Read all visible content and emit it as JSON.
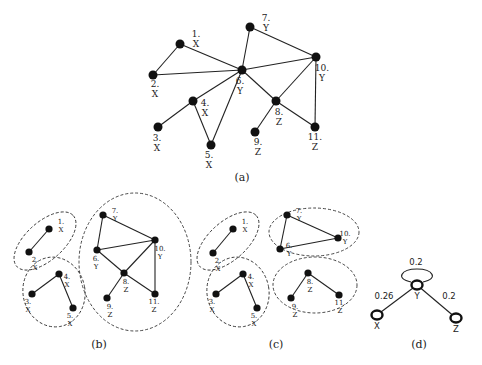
{
  "panels": {
    "a": {
      "caption": "(a)",
      "caption_pos": [
        242,
        181
      ],
      "node_radius": 4.5,
      "label_class": "lbl-a",
      "nodes": [
        {
          "id": "1",
          "x": 180,
          "y": 44,
          "num": "1.",
          "cls": "X",
          "lx": 196,
          "ly": 37
        },
        {
          "id": "2",
          "x": 153,
          "y": 75,
          "num": "2.",
          "cls": "X",
          "lx": 155,
          "ly": 87
        },
        {
          "id": "3",
          "x": 158,
          "y": 127,
          "num": "3.",
          "cls": "X",
          "lx": 157,
          "ly": 141
        },
        {
          "id": "4",
          "x": 193,
          "y": 101,
          "num": "4.",
          "cls": "X",
          "lx": 205,
          "ly": 106
        },
        {
          "id": "5",
          "x": 211,
          "y": 145,
          "num": "5.",
          "cls": "X",
          "lx": 209,
          "ly": 158
        },
        {
          "id": "6",
          "x": 242,
          "y": 70,
          "num": "6.",
          "cls": "Y",
          "lx": 240,
          "ly": 84
        },
        {
          "id": "7",
          "x": 250,
          "y": 27,
          "num": "7.",
          "cls": "Y",
          "lx": 266,
          "ly": 21
        },
        {
          "id": "8",
          "x": 276,
          "y": 101,
          "num": "8.",
          "cls": "Z",
          "lx": 279,
          "ly": 115
        },
        {
          "id": "9",
          "x": 255,
          "y": 132,
          "num": "9.",
          "cls": "Z",
          "lx": 258,
          "ly": 145
        },
        {
          "id": "10",
          "x": 316,
          "y": 57,
          "num": "10.",
          "cls": "Y",
          "lx": 322,
          "ly": 71
        },
        {
          "id": "11",
          "x": 315,
          "y": 127,
          "num": "11.",
          "cls": "Z",
          "lx": 315,
          "ly": 140
        }
      ],
      "edges": [
        [
          "1",
          "2"
        ],
        [
          "1",
          "6"
        ],
        [
          "2",
          "6"
        ],
        [
          "6",
          "7"
        ],
        [
          "6",
          "10"
        ],
        [
          "7",
          "10"
        ],
        [
          "6",
          "4"
        ],
        [
          "6",
          "5"
        ],
        [
          "4",
          "3"
        ],
        [
          "4",
          "5"
        ],
        [
          "6",
          "8"
        ],
        [
          "8",
          "10"
        ],
        [
          "10",
          "11"
        ],
        [
          "8",
          "11"
        ],
        [
          "8",
          "9"
        ]
      ]
    },
    "b": {
      "caption": "(b)",
      "caption_pos": [
        99,
        348
      ],
      "node_radius": 3.6,
      "label_class": "lbl-s",
      "clusters": [
        {
          "cx": 45,
          "cy": 241,
          "rx": 38,
          "ry": 19,
          "rot": -42
        },
        {
          "cx": 54,
          "cy": 292,
          "rx": 31,
          "ry": 35,
          "rot": -10
        },
        {
          "cx": 135,
          "cy": 262,
          "rx": 56,
          "ry": 69,
          "rot": 0
        }
      ],
      "nodes": [
        {
          "id": "1",
          "x": 49,
          "y": 229,
          "num": "1.",
          "cls": "X",
          "lx": 61,
          "ly": 224
        },
        {
          "id": "2",
          "x": 29,
          "y": 252,
          "num": "2.",
          "cls": "X",
          "lx": 35,
          "ly": 262
        },
        {
          "id": "3",
          "x": 32,
          "y": 294,
          "num": "3.",
          "cls": "X",
          "lx": 28,
          "ly": 304
        },
        {
          "id": "4",
          "x": 59,
          "y": 274,
          "num": "4.",
          "cls": "X",
          "lx": 67,
          "ly": 279
        },
        {
          "id": "5",
          "x": 73,
          "y": 308,
          "num": "5.",
          "cls": "X",
          "lx": 70,
          "ly": 318
        },
        {
          "id": "6",
          "x": 97,
          "y": 250,
          "num": "6.",
          "cls": "Y",
          "lx": 96,
          "ly": 261
        },
        {
          "id": "7",
          "x": 103,
          "y": 215,
          "num": "7.",
          "cls": "Y",
          "lx": 115,
          "ly": 213
        },
        {
          "id": "8",
          "x": 124,
          "y": 273,
          "num": "8.",
          "cls": "Z",
          "lx": 126,
          "ly": 284
        },
        {
          "id": "9",
          "x": 107,
          "y": 298,
          "num": "9.",
          "cls": "Z",
          "lx": 110,
          "ly": 309
        },
        {
          "id": "10",
          "x": 155,
          "y": 240,
          "num": "10.",
          "cls": "Y",
          "lx": 160,
          "ly": 251
        },
        {
          "id": "11",
          "x": 155,
          "y": 294,
          "num": "11.",
          "cls": "Z",
          "lx": 154,
          "ly": 304
        }
      ],
      "edges": [
        [
          "1",
          "2"
        ],
        [
          "4",
          "3"
        ],
        [
          "4",
          "5"
        ],
        [
          "7",
          "6"
        ],
        [
          "7",
          "10"
        ],
        [
          "6",
          "10"
        ],
        [
          "6",
          "8"
        ],
        [
          "8",
          "10"
        ],
        [
          "10",
          "11"
        ],
        [
          "8",
          "11"
        ],
        [
          "8",
          "9"
        ]
      ]
    },
    "c": {
      "caption": "(c)",
      "caption_pos": [
        276,
        348
      ],
      "node_radius": 3.6,
      "label_class": "lbl-s",
      "clusters": [
        {
          "cx": 228,
          "cy": 241,
          "rx": 38,
          "ry": 19,
          "rot": -42
        },
        {
          "cx": 238,
          "cy": 292,
          "rx": 31,
          "ry": 35,
          "rot": -10
        },
        {
          "cx": 314,
          "cy": 232,
          "rx": 45,
          "ry": 24,
          "rot": 0
        },
        {
          "cx": 315,
          "cy": 285,
          "rx": 42,
          "ry": 28,
          "rot": 0
        }
      ],
      "nodes": [
        {
          "id": "1",
          "x": 233,
          "y": 229,
          "num": "1.",
          "cls": "X",
          "lx": 245,
          "ly": 224
        },
        {
          "id": "2",
          "x": 213,
          "y": 253,
          "num": "2.",
          "cls": "X",
          "lx": 218,
          "ly": 263
        },
        {
          "id": "3",
          "x": 216,
          "y": 294,
          "num": "3.",
          "cls": "X",
          "lx": 212,
          "ly": 304
        },
        {
          "id": "4",
          "x": 243,
          "y": 274,
          "num": "4.",
          "cls": "X",
          "lx": 251,
          "ly": 279
        },
        {
          "id": "5",
          "x": 257,
          "y": 308,
          "num": "5.",
          "cls": "X",
          "lx": 254,
          "ly": 318
        },
        {
          "id": "6",
          "x": 280,
          "y": 249,
          "num": "6.",
          "cls": "Y",
          "lx": 289,
          "ly": 248
        },
        {
          "id": "7",
          "x": 287,
          "y": 215,
          "num": "7.",
          "cls": "Y",
          "lx": 299,
          "ly": 213
        },
        {
          "id": "8",
          "x": 308,
          "y": 273,
          "num": "8.",
          "cls": "Z",
          "lx": 310,
          "ly": 284
        },
        {
          "id": "9",
          "x": 291,
          "y": 298,
          "num": "9.",
          "cls": "Z",
          "lx": 295,
          "ly": 309
        },
        {
          "id": "10",
          "x": 338,
          "y": 238,
          "num": "10.",
          "cls": "Y",
          "lx": 345,
          "ly": 236
        },
        {
          "id": "11",
          "x": 339,
          "y": 295,
          "num": "11.",
          "cls": "Z",
          "lx": 340,
          "ly": 305
        }
      ],
      "edges": [
        [
          "1",
          "2"
        ],
        [
          "4",
          "3"
        ],
        [
          "4",
          "5"
        ],
        [
          "7",
          "6"
        ],
        [
          "7",
          "10"
        ],
        [
          "6",
          "10"
        ],
        [
          "8",
          "9"
        ],
        [
          "8",
          "11"
        ]
      ]
    },
    "d": {
      "caption": "(d)",
      "caption_pos": [
        419,
        348
      ],
      "nodes": [
        {
          "id": "X",
          "x": 377,
          "y": 315,
          "label": "X",
          "lx": 377,
          "ly": 329
        },
        {
          "id": "Y",
          "x": 417,
          "y": 285,
          "label": "Y",
          "lx": 417,
          "ly": 299
        },
        {
          "id": "Z",
          "x": 456,
          "y": 318,
          "label": "Z",
          "lx": 456,
          "ly": 332
        }
      ],
      "edges": [
        {
          "from": "Y",
          "to": "X",
          "weight": "0.26",
          "wx": 384,
          "wy": 299
        },
        {
          "from": "Y",
          "to": "Z",
          "weight": "0.2",
          "wx": 449,
          "wy": 299
        }
      ],
      "self_loop": {
        "node": "Y",
        "weight": "0.2",
        "wx": 416,
        "wy": 265
      }
    }
  }
}
